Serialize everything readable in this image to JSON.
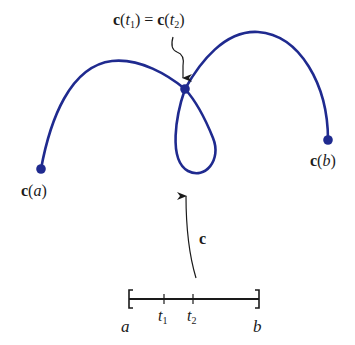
{
  "figure": {
    "curve_color": "#1f2a8f",
    "ink_color": "#1a1a1a",
    "labels": {
      "intersection": {
        "c1": "c",
        "open1": "(",
        "t1": "t",
        "sub1": "1",
        "close1": ")",
        "eq": " = ",
        "c2": "c",
        "open2": "(",
        "t2": "t",
        "sub2": "2",
        "close2": ")"
      },
      "start": {
        "c": "c",
        "open": "(",
        "var": "a",
        "close": ")"
      },
      "end": {
        "c": "c",
        "open": "(",
        "var": "b",
        "close": ")"
      },
      "map": "c"
    },
    "interval": {
      "left_bracket": "[",
      "right_bracket": "]",
      "a": "a",
      "b": "b",
      "t1": {
        "t": "t",
        "sub": "1"
      },
      "t2": {
        "t": "t",
        "sub": "2"
      }
    }
  }
}
